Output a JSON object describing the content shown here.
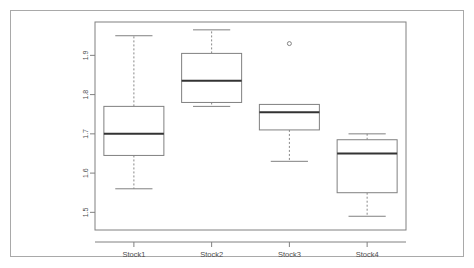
{
  "figure": {
    "background_color": "#ffffff",
    "frame_color": "#a9a9a9",
    "panel_color": "#808080",
    "box_color": "#808080",
    "median_color": "#333333",
    "whisker_color": "#888888",
    "outlier_color": "#666666",
    "tick_text_color": "#4d4d4d"
  },
  "chart_data": {
    "type": "box",
    "title": "",
    "xlabel": "",
    "ylabel": "",
    "categories": [
      "Stock1",
      "Stock2",
      "Stock3",
      "Stock4"
    ],
    "y_ticks": [
      1.5,
      1.6,
      1.7,
      1.8,
      1.9
    ],
    "y_tick_labels": [
      "1.5",
      "1.6",
      "1.7",
      "1.8",
      "1.9"
    ],
    "ylim": [
      1.455,
      1.985
    ],
    "grid": false,
    "legend": null,
    "y_tick_label_rotation": 90,
    "boxes": [
      {
        "name": "Stock1",
        "whisker_low": 1.56,
        "q1": 1.645,
        "median": 1.7,
        "q3": 1.77,
        "whisker_high": 1.95,
        "outliers": []
      },
      {
        "name": "Stock2",
        "whisker_low": 1.77,
        "q1": 1.78,
        "median": 1.835,
        "q3": 1.905,
        "whisker_high": 1.965,
        "outliers": []
      },
      {
        "name": "Stock3",
        "whisker_low": 1.63,
        "q1": 1.71,
        "median": 1.755,
        "q3": 1.775,
        "whisker_high": 1.775,
        "outliers": [
          1.93
        ]
      },
      {
        "name": "Stock4",
        "whisker_low": 1.49,
        "q1": 1.55,
        "median": 1.65,
        "q3": 1.685,
        "whisker_high": 1.7,
        "outliers": []
      }
    ]
  }
}
